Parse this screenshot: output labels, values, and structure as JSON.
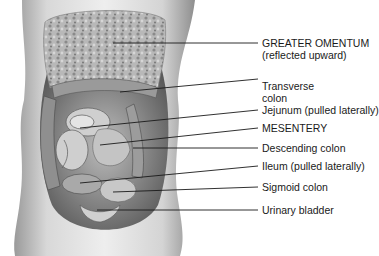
{
  "figure": {
    "labels": [
      {
        "id": "greater-omentum",
        "line1": "GREATER OMENTUM",
        "line2": "(reflected upward)"
      },
      {
        "id": "transverse-colon",
        "line1": "Transverse",
        "line2": "colon"
      },
      {
        "id": "jejunum",
        "line1": "Jejunum (pulled laterally)"
      },
      {
        "id": "mesentery",
        "line1": "MESENTERY"
      },
      {
        "id": "descending-colon",
        "line1": "Descending colon"
      },
      {
        "id": "ileum",
        "line1": "Ileum (pulled laterally)"
      },
      {
        "id": "sigmoid-colon",
        "line1": "Sigmoid colon"
      },
      {
        "id": "urinary-bladder",
        "line1": "Urinary bladder"
      }
    ]
  }
}
